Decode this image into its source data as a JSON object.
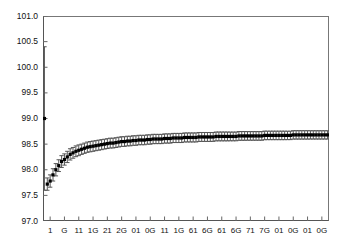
{
  "chart_data": {
    "type": "scatter",
    "title": "",
    "subtitle": "",
    "xlabel": "",
    "ylabel": "",
    "grid": false,
    "legend": "none",
    "marker": "filled-square",
    "errorbars": "vertical-caps",
    "ylim": [
      97.0,
      101.0
    ],
    "ytick_labels": [
      "101.0",
      "100.5",
      "100.0",
      "99.5",
      "99.0",
      "98.5",
      "98.0",
      "97.5",
      "97.0"
    ],
    "ytick_values": [
      101.0,
      100.5,
      100.0,
      99.5,
      99.0,
      98.5,
      98.0,
      97.5,
      97.0
    ],
    "xtick_labels": [
      "1",
      "G",
      "11",
      "1G",
      "21",
      "2G",
      "01",
      "0G",
      "11",
      "1G",
      "61",
      "6G",
      "61",
      "6G",
      "71",
      "7G",
      "01",
      "0G",
      "01",
      "0G"
    ],
    "xlim": [
      0.5,
      100.5
    ],
    "series": [
      {
        "name": "series-1",
        "x": [
          1,
          2,
          3,
          4,
          5,
          6,
          7,
          8,
          9,
          10,
          11,
          12,
          13,
          14,
          15,
          16,
          17,
          18,
          19,
          20,
          21,
          22,
          23,
          24,
          25,
          26,
          27,
          28,
          29,
          30,
          31,
          32,
          33,
          34,
          35,
          36,
          37,
          38,
          39,
          40,
          41,
          42,
          43,
          44,
          45,
          46,
          47,
          48,
          49,
          50,
          51,
          52,
          53,
          54,
          55,
          56,
          57,
          58,
          59,
          60,
          61,
          62,
          63,
          64,
          65,
          66,
          67,
          68,
          69,
          70,
          71,
          72,
          73,
          74,
          75,
          76,
          77,
          78,
          79,
          80,
          81,
          82,
          83,
          84,
          85,
          86,
          87,
          88,
          89,
          90,
          91,
          92,
          93,
          94,
          95,
          96,
          97,
          98,
          99,
          100
        ],
        "y": [
          99.0,
          97.72,
          97.78,
          97.9,
          98.0,
          98.08,
          98.16,
          98.2,
          98.25,
          98.3,
          98.33,
          98.36,
          98.38,
          98.4,
          98.42,
          98.44,
          98.45,
          98.46,
          98.47,
          98.48,
          98.49,
          98.5,
          98.51,
          98.52,
          98.52,
          98.53,
          98.54,
          98.55,
          98.55,
          98.56,
          98.56,
          98.57,
          98.57,
          98.58,
          98.58,
          98.58,
          98.59,
          98.59,
          98.6,
          98.6,
          98.6,
          98.6,
          98.61,
          98.61,
          98.61,
          98.62,
          98.62,
          98.62,
          98.62,
          98.63,
          98.63,
          98.63,
          98.63,
          98.63,
          98.64,
          98.64,
          98.64,
          98.64,
          98.64,
          98.64,
          98.65,
          98.65,
          98.65,
          98.65,
          98.65,
          98.65,
          98.65,
          98.65,
          98.66,
          98.66,
          98.66,
          98.66,
          98.66,
          98.66,
          98.66,
          98.66,
          98.66,
          98.67,
          98.67,
          98.67,
          98.67,
          98.67,
          98.67,
          98.67,
          98.67,
          98.67,
          98.67,
          98.68,
          98.68,
          98.68,
          98.68,
          98.68,
          98.68,
          98.68,
          98.68,
          98.68,
          98.68,
          98.68,
          98.68,
          98.68
        ],
        "yerr": [
          1.4,
          0.12,
          0.12,
          0.12,
          0.12,
          0.115,
          0.115,
          0.11,
          0.11,
          0.11,
          0.105,
          0.105,
          0.105,
          0.1,
          0.1,
          0.1,
          0.1,
          0.1,
          0.098,
          0.098,
          0.098,
          0.096,
          0.096,
          0.096,
          0.095,
          0.095,
          0.095,
          0.094,
          0.094,
          0.094,
          0.093,
          0.093,
          0.093,
          0.092,
          0.092,
          0.092,
          0.091,
          0.091,
          0.091,
          0.09,
          0.09,
          0.09,
          0.09,
          0.09,
          0.09,
          0.089,
          0.089,
          0.089,
          0.089,
          0.088,
          0.088,
          0.088,
          0.088,
          0.088,
          0.087,
          0.087,
          0.087,
          0.087,
          0.087,
          0.086,
          0.086,
          0.086,
          0.086,
          0.086,
          0.086,
          0.085,
          0.085,
          0.085,
          0.085,
          0.085,
          0.085,
          0.084,
          0.084,
          0.084,
          0.084,
          0.084,
          0.084,
          0.084,
          0.083,
          0.083,
          0.083,
          0.083,
          0.083,
          0.083,
          0.083,
          0.082,
          0.082,
          0.082,
          0.082,
          0.082,
          0.082,
          0.082,
          0.082,
          0.081,
          0.081,
          0.081,
          0.081,
          0.081,
          0.081,
          0.081
        ]
      }
    ],
    "colors": {
      "marker": "#000000",
      "errorbar": "#555555",
      "frame": "#666666",
      "background": "#ffffff",
      "text": "#111111"
    }
  }
}
